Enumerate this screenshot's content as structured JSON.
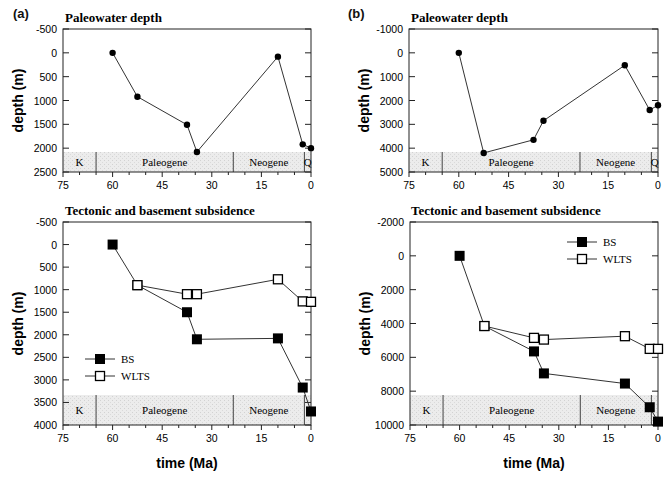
{
  "panels": [
    {
      "label": "(a)"
    },
    {
      "label": "(b)"
    }
  ],
  "xlabel": "time  (Ma)",
  "ylabel": "depth  (m)",
  "eras": [
    "K",
    "Paleogene",
    "Neogene",
    "Q"
  ],
  "legend": {
    "bs": "BS",
    "wlts": "WLTS"
  },
  "chart_data": [
    {
      "panel": "a",
      "type": "line",
      "title": "Paleowater depth",
      "xlabel": "time (Ma)",
      "ylabel": "depth (m)",
      "xlim": [
        75,
        0
      ],
      "ylim": [
        -500,
        2500
      ],
      "y_inverted": true,
      "xticks": [
        75,
        60,
        45,
        30,
        15,
        0
      ],
      "yticks": [
        -500,
        0,
        500,
        1000,
        1500,
        2000,
        2500
      ],
      "series": [
        {
          "name": "Paleowater depth",
          "marker": "circle",
          "x": [
            60,
            52.5,
            37.5,
            34.5,
            10,
            2.5,
            0
          ],
          "y": [
            0,
            920,
            1510,
            2080,
            80,
            1920,
            2000
          ]
        }
      ],
      "era_band": {
        "eras": [
          "K",
          "Paleogene",
          "Neogene",
          "Q"
        ],
        "boundaries": [
          65,
          23.5,
          2
        ]
      }
    },
    {
      "panel": "a",
      "type": "line",
      "title": "Tectonic and basement subsidence",
      "xlabel": "time (Ma)",
      "ylabel": "depth (m)",
      "xlim": [
        75,
        0
      ],
      "ylim": [
        -500,
        4000
      ],
      "y_inverted": true,
      "xticks": [
        75,
        60,
        45,
        30,
        15,
        0
      ],
      "yticks": [
        -500,
        0,
        500,
        1000,
        1500,
        2000,
        2500,
        3000,
        3500,
        4000
      ],
      "legend_position": "lower-left",
      "series": [
        {
          "name": "BS",
          "marker": "filled-square",
          "x": [
            60,
            52.5,
            37.5,
            34.5,
            10,
            2.5,
            0
          ],
          "y": [
            0,
            900,
            1500,
            2100,
            2080,
            3170,
            3700
          ]
        },
        {
          "name": "WLTS",
          "marker": "open-square",
          "x": [
            52.5,
            37.5,
            34.5,
            10,
            2.5,
            0
          ],
          "y": [
            900,
            1100,
            1100,
            770,
            1260,
            1270
          ]
        }
      ],
      "era_band": {
        "eras": [
          "K",
          "Paleogene",
          "Neogene"
        ],
        "boundaries": [
          65,
          23.5,
          2
        ]
      }
    },
    {
      "panel": "b",
      "type": "line",
      "title": "Paleowater depth",
      "xlabel": "time (Ma)",
      "ylabel": "depth (m)",
      "xlim": [
        75,
        0
      ],
      "ylim": [
        -1000,
        5000
      ],
      "y_inverted": true,
      "xticks": [
        75,
        60,
        45,
        30,
        15,
        0
      ],
      "yticks": [
        -1000,
        0,
        1000,
        2000,
        3000,
        4000,
        5000
      ],
      "series": [
        {
          "name": "Paleowater depth",
          "marker": "circle",
          "x": [
            60,
            52.5,
            37.5,
            34.5,
            10,
            2.5,
            0
          ],
          "y": [
            0,
            4200,
            3650,
            2850,
            520,
            2400,
            2200
          ]
        }
      ],
      "era_band": {
        "eras": [
          "K",
          "Paleogene",
          "Neogene",
          "Q"
        ],
        "boundaries": [
          65,
          23.5,
          2
        ]
      }
    },
    {
      "panel": "b",
      "type": "line",
      "title": "Tectonic and basement subsidence",
      "xlabel": "time (Ma)",
      "ylabel": "depth (m)",
      "xlim": [
        75,
        0
      ],
      "ylim": [
        -2000,
        10000
      ],
      "y_inverted": true,
      "xticks": [
        75,
        60,
        45,
        30,
        15,
        0
      ],
      "yticks": [
        -2000,
        0,
        2000,
        4000,
        6000,
        8000,
        10000
      ],
      "legend_position": "upper-right",
      "series": [
        {
          "name": "BS",
          "marker": "filled-square",
          "x": [
            60,
            52.5,
            37.5,
            34.5,
            10,
            2.5,
            0
          ],
          "y": [
            0,
            4150,
            5650,
            6950,
            7550,
            8950,
            9800
          ]
        },
        {
          "name": "WLTS",
          "marker": "open-square",
          "x": [
            52.5,
            37.5,
            34.5,
            10,
            2.5,
            0
          ],
          "y": [
            4150,
            4850,
            4950,
            4750,
            5500,
            5500
          ]
        }
      ],
      "era_band": {
        "eras": [
          "K",
          "Paleogene",
          "Neogene"
        ],
        "boundaries": [
          65,
          23.5,
          2
        ]
      }
    }
  ]
}
